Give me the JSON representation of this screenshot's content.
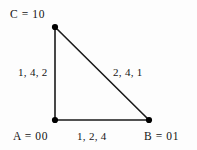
{
  "diagram": {
    "background_color": "#fdfdfd",
    "stroke_color": "#1a1a1a",
    "vertex_fill_color": "#000000",
    "vertices": [
      {
        "id": "C",
        "label": "C = 10",
        "name": "C",
        "value": "10",
        "x": 55,
        "y": 27
      },
      {
        "id": "A",
        "label": "A = 00",
        "name": "A",
        "value": "00",
        "x": 55,
        "y": 120
      },
      {
        "id": "B",
        "label": "B = 01",
        "name": "B",
        "value": "01",
        "x": 149,
        "y": 120
      }
    ],
    "edges": [
      {
        "id": "AC",
        "from": "A",
        "to": "C",
        "label": "1, 4, 2",
        "weights": [
          1,
          4,
          2
        ]
      },
      {
        "id": "CB",
        "from": "C",
        "to": "B",
        "label": "2, 4, 1",
        "weights": [
          2,
          4,
          1
        ]
      },
      {
        "id": "AB",
        "from": "A",
        "to": "B",
        "label": "1, 2, 4",
        "weights": [
          1,
          2,
          4
        ]
      }
    ]
  }
}
